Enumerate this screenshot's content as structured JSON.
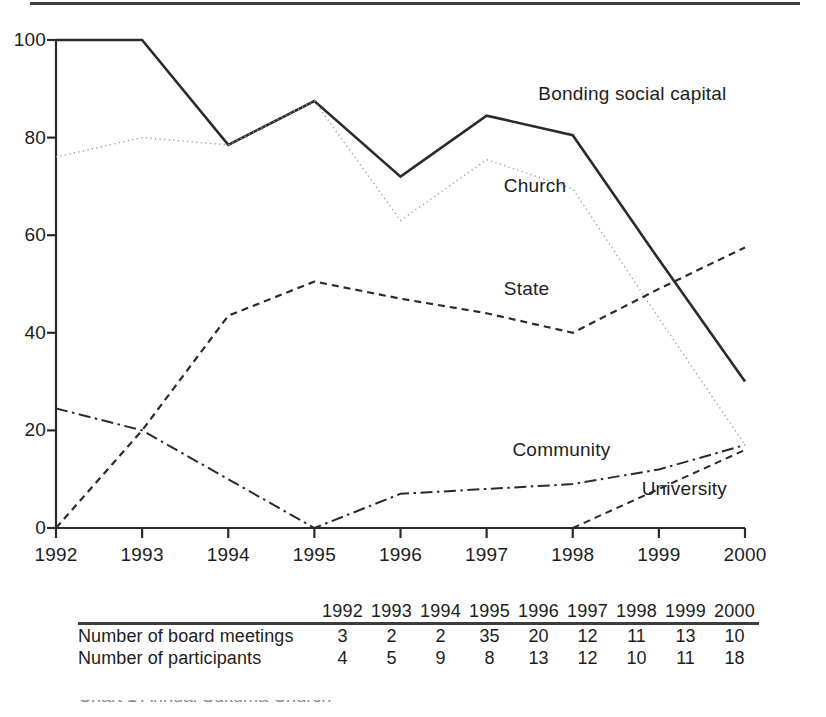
{
  "figure": {
    "top_rule": "horizontal-rule"
  },
  "chart_data": {
    "type": "line",
    "title": "",
    "xlabel": "",
    "ylabel": "",
    "x": [
      1992,
      1993,
      1994,
      1995,
      1996,
      1997,
      1998,
      1999,
      2000
    ],
    "categories": [
      "1992",
      "1993",
      "1994",
      "1995",
      "1996",
      "1997",
      "1998",
      "1999",
      "2000"
    ],
    "xlim": [
      1992,
      2000
    ],
    "ylim": [
      0,
      100
    ],
    "yticks": [
      0,
      20,
      40,
      60,
      80,
      100
    ],
    "ytick_labels": [
      "0",
      "20",
      "40",
      "60",
      "80",
      "100"
    ],
    "xtick_labels": [
      "1992",
      "1993",
      "1994",
      "1995",
      "1996",
      "1997",
      "1998",
      "1999",
      "2000"
    ],
    "grid": false,
    "legend": "inline-labels",
    "series": [
      {
        "name": "Bonding social capital",
        "style": "solid",
        "color": "#2b2b2b",
        "width": 2.6,
        "label_x": 1997.6,
        "label_y": 89,
        "values": [
          100,
          100,
          78.5,
          87.5,
          72,
          84.5,
          80.5,
          55,
          30
        ]
      },
      {
        "name": "Church",
        "style": "dotted",
        "color": "#9a9a9a",
        "width": 1.4,
        "label_x": 1997.2,
        "label_y": 70,
        "values": [
          76,
          80,
          78.5,
          87.5,
          63,
          75.5,
          69.5,
          43,
          17
        ]
      },
      {
        "name": "State",
        "style": "dashed",
        "color": "#2b2b2b",
        "width": 2.2,
        "label_x": 1997.2,
        "label_y": 49,
        "values": [
          0,
          20,
          43.5,
          50.5,
          47,
          44,
          40,
          49,
          57.5
        ]
      },
      {
        "name": "Community",
        "style": "dashdot",
        "color": "#2b2b2b",
        "width": 2.0,
        "label_x": 1997.3,
        "label_y": 16,
        "values": [
          24.5,
          20,
          10,
          0,
          7,
          8,
          9,
          12,
          17
        ]
      },
      {
        "name": "University",
        "style": "dashed",
        "color": "#2b2b2b",
        "width": 2.0,
        "label_x": 1998.8,
        "label_y": 8,
        "values": [
          null,
          null,
          null,
          null,
          null,
          null,
          0,
          8,
          16
        ]
      }
    ]
  },
  "table": {
    "corner": "",
    "columns": [
      "1992",
      "1993",
      "1994",
      "1995",
      "1996",
      "1997",
      "1998",
      "1999",
      "2000"
    ],
    "rows": [
      {
        "label": "Number of board meetings",
        "values": [
          "3",
          "2",
          "2",
          "35",
          "20",
          "12",
          "11",
          "13",
          "10"
        ]
      },
      {
        "label": "Number of participants",
        "values": [
          "4",
          "5",
          "9",
          "8",
          "13",
          "12",
          "10",
          "11",
          "18"
        ]
      }
    ]
  },
  "caption": {
    "clipped_text": "Chart 1    Annual Sukuma Church"
  }
}
